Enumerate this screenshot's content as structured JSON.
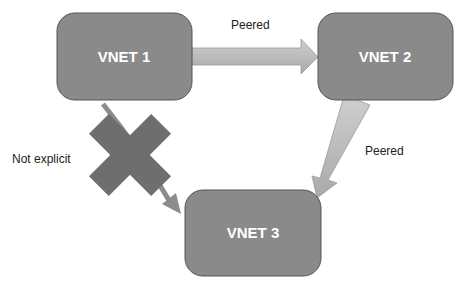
{
  "diagram": {
    "nodes": [
      {
        "id": "vnet1",
        "label": "VNET 1"
      },
      {
        "id": "vnet2",
        "label": "VNET 2"
      },
      {
        "id": "vnet3",
        "label": "VNET 3"
      }
    ],
    "edges": [
      {
        "from": "vnet1",
        "to": "vnet2",
        "label": "Peered",
        "status": "peered"
      },
      {
        "from": "vnet2",
        "to": "vnet3",
        "label": "Peered",
        "status": "peered"
      },
      {
        "from": "vnet1",
        "to": "vnet3",
        "label": "Not explicit",
        "status": "blocked",
        "marker": "x-cross-icon"
      }
    ],
    "colors": {
      "node_fill": "#8a8a8a",
      "node_stroke": "#555555",
      "arrow_fill": "#bdbdbd",
      "cross_fill": "#6e6e6e"
    }
  }
}
